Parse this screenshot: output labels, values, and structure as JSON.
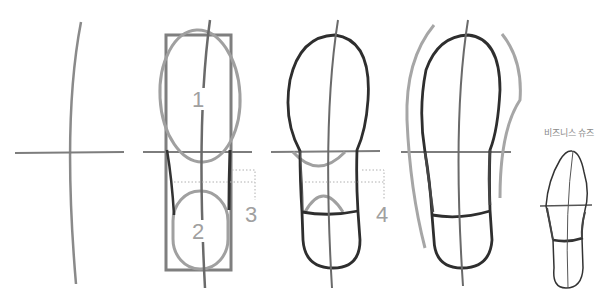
{
  "diagram": {
    "steps": [
      {
        "id": "step-1",
        "description": "Center axis curve with horizontal ball line"
      },
      {
        "id": "step-2",
        "description": "Bounding rectangle with toe ellipse and heel ellipse"
      },
      {
        "id": "step-3",
        "description": "Connected sole outline with heel separation"
      },
      {
        "id": "step-4",
        "description": "Final sole with side contour guides"
      },
      {
        "id": "step-5",
        "description": "Business shoe example"
      }
    ],
    "labels": {
      "toe_ellipse": "1",
      "heel_ellipse": "2",
      "waist_measure_a": "3",
      "waist_measure_b": "4",
      "business_shoes": "비즈니스 슈즈"
    },
    "colors": {
      "guide_gray": "#8c8c8c",
      "light_gray": "#a6a6a6",
      "outline_dark": "#333333",
      "dotted": "#b0b0b0",
      "background": "#ffffff"
    }
  }
}
